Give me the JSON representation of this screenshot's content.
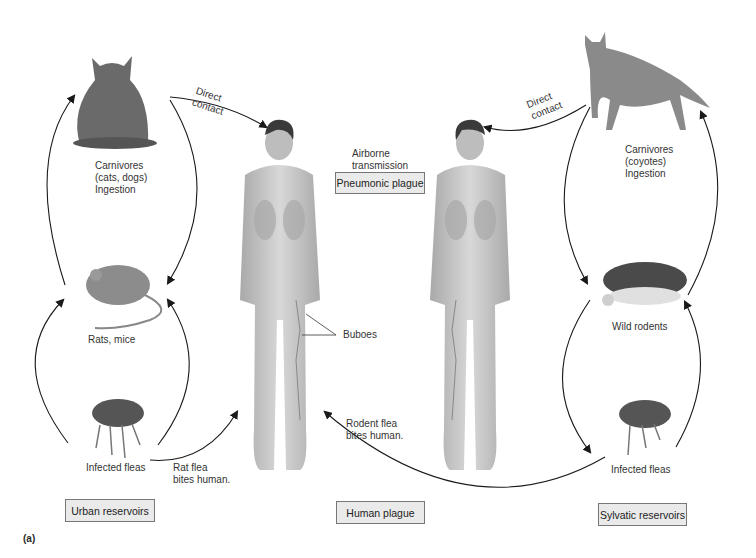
{
  "figure_label": "(a)",
  "labels": {
    "cat": "Carnivores\n(cats, dogs)\nIngestion",
    "coyote": "Carnivores\n(coyotes)\nIngestion",
    "rats": "Rats, mice",
    "wild_rodents": "Wild rodents",
    "fleas_left": "Infected fleas",
    "fleas_right": "Infected fleas",
    "direct_contact_left": "Direct\ncontact",
    "direct_contact_right": "Direct\ncontact",
    "airborne": "Airborne\ntransmission",
    "buboes": "Buboes",
    "rat_flea": "Rat flea\nbites human.",
    "rodent_flea": "Rodent flea\nbites human."
  },
  "boxes": {
    "pneumonic": "Pneumonic plague",
    "urban": "Urban reservoirs",
    "human": "Human plague",
    "sylvatic": "Sylvatic reservoirs"
  },
  "colors": {
    "arrow": "#1a1a1a",
    "box_fill": "#eaeaea",
    "skin": "#c9c9c9",
    "hair": "#3a3a3a"
  }
}
